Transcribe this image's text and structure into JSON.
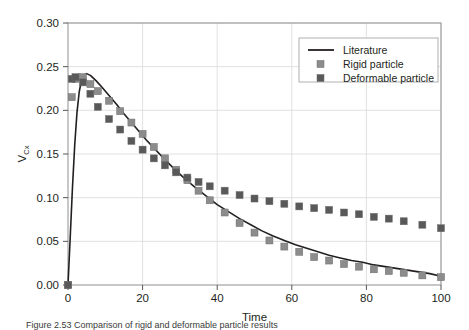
{
  "figure": {
    "background": "#ffffff",
    "caption": "Figure 2.53   Comparison of rigid and deformable particle results"
  },
  "chart_data": {
    "type": "line",
    "title": "",
    "xlabel": "Time",
    "ylabel": "V",
    "ylabel_subscript": "Cx",
    "xlim": [
      0,
      100
    ],
    "ylim": [
      0,
      0.3
    ],
    "xticks": [
      0,
      20,
      40,
      60,
      80,
      100
    ],
    "xtick_labels": [
      "0",
      "20",
      "40",
      "60",
      "80",
      "100"
    ],
    "yticks": [
      0.0,
      0.05,
      0.1,
      0.15,
      0.2,
      0.25,
      0.3
    ],
    "ytick_labels": [
      "0.00",
      "0.05",
      "0.10",
      "0.15",
      "0.20",
      "0.25",
      "0.30"
    ],
    "grid": true,
    "grid_color": "#d9d9d9",
    "legend_position": "top-right",
    "series": [
      {
        "name": "Literature",
        "style": "line",
        "color": "#231f20",
        "x": [
          0,
          0.6,
          1.2,
          1.8,
          2.4,
          3.0,
          3.6,
          4.2,
          5.0,
          6.0,
          7.5,
          9.0,
          11,
          13,
          15,
          17,
          19,
          21,
          23,
          25,
          28,
          31,
          34,
          37,
          40,
          43,
          46,
          49,
          52,
          55,
          58,
          61,
          64,
          67,
          70,
          73,
          76,
          79,
          82,
          85,
          88,
          91,
          94,
          97,
          100
        ],
        "y": [
          0.0,
          0.055,
          0.112,
          0.16,
          0.197,
          0.221,
          0.234,
          0.24,
          0.242,
          0.24,
          0.234,
          0.227,
          0.217,
          0.207,
          0.196,
          0.186,
          0.176,
          0.166,
          0.157,
          0.148,
          0.135,
          0.123,
          0.112,
          0.102,
          0.092,
          0.084,
          0.076,
          0.069,
          0.062,
          0.056,
          0.051,
          0.046,
          0.042,
          0.038,
          0.034,
          0.031,
          0.028,
          0.026,
          0.023,
          0.021,
          0.019,
          0.017,
          0.015,
          0.013,
          0.01
        ]
      },
      {
        "name": "Rigid particle",
        "style": "markers",
        "color": "#8c8c8c",
        "marker": "square",
        "x": [
          0,
          1,
          2,
          4,
          6,
          8,
          11,
          14,
          17,
          20,
          23,
          26,
          29,
          32,
          35,
          38,
          42,
          46,
          50,
          54,
          58,
          62,
          66,
          70,
          74,
          78,
          82,
          86,
          90,
          95,
          100
        ],
        "y": [
          0.0,
          0.215,
          0.236,
          0.238,
          0.23,
          0.222,
          0.211,
          0.199,
          0.186,
          0.173,
          0.158,
          0.145,
          0.132,
          0.12,
          0.108,
          0.097,
          0.083,
          0.071,
          0.06,
          0.051,
          0.044,
          0.038,
          0.032,
          0.028,
          0.024,
          0.021,
          0.018,
          0.016,
          0.014,
          0.011,
          0.009
        ]
      },
      {
        "name": "Deformable particle",
        "style": "markers",
        "color": "#595959",
        "marker": "square",
        "x": [
          0,
          1,
          2,
          4,
          6,
          8,
          11,
          14,
          17,
          20,
          23,
          26,
          29,
          32,
          35,
          38,
          42,
          46,
          50,
          54,
          58,
          62,
          66,
          70,
          74,
          78,
          82,
          86,
          90,
          95,
          100
        ],
        "y": [
          0.0,
          0.236,
          0.238,
          0.232,
          0.219,
          0.204,
          0.19,
          0.178,
          0.165,
          0.155,
          0.145,
          0.137,
          0.129,
          0.123,
          0.118,
          0.113,
          0.108,
          0.103,
          0.099,
          0.096,
          0.093,
          0.09,
          0.088,
          0.086,
          0.083,
          0.081,
          0.078,
          0.076,
          0.073,
          0.069,
          0.065
        ]
      }
    ]
  }
}
